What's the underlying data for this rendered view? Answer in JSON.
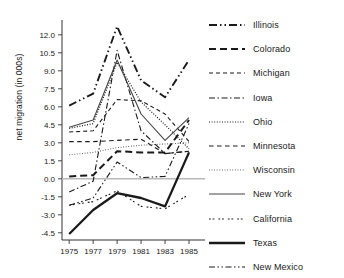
{
  "chart_data": {
    "type": "line",
    "title": "",
    "xlabel": "",
    "ylabel": "net migration (in 000s)",
    "x": [
      1975,
      1977,
      1979,
      1981,
      1983,
      1985
    ],
    "xtick_labels": [
      "1975",
      "1977",
      "1979",
      "1981",
      "1983",
      "1985"
    ],
    "ytick_labels": [
      "12.0",
      "10.5",
      "9.0",
      "7.5",
      "6.0",
      "4.5",
      "3.0",
      "1.5",
      "0.0",
      "-1.5",
      "-3.0",
      "-4.5"
    ],
    "ytick_values": [
      12.0,
      10.5,
      9.0,
      7.5,
      6.0,
      4.5,
      3.0,
      1.5,
      0.0,
      -1.5,
      -3.0,
      -4.5
    ],
    "xlim": [
      1974.4,
      1986.0
    ],
    "ylim": [
      -5.1,
      12.9
    ],
    "grid": false,
    "zero_line": true,
    "legend_position": "right",
    "series": [
      {
        "name": "Illinois",
        "dash": "8,3,1.5,3,1.5,3",
        "width": 1.9,
        "color": "#1a1a1a",
        "values": [
          6.1,
          7.1,
          12.7,
          8.2,
          6.8,
          9.9
        ]
      },
      {
        "name": "Colorado",
        "dash": "7,4",
        "width": 2.0,
        "color": "#1a1a1a",
        "values": [
          0.2,
          0.3,
          2.3,
          2.2,
          2.2,
          4.9
        ]
      },
      {
        "name": "Michigan",
        "dash": "4,3",
        "width": 1.1,
        "color": "#1a1a1a",
        "values": [
          3.9,
          4.0,
          6.6,
          6.5,
          5.4,
          3.1
        ]
      },
      {
        "name": "Iowa",
        "dash": "6,2.5,1.5,2.5",
        "width": 1.1,
        "color": "#1a1a1a",
        "values": [
          -1.1,
          -0.2,
          10.7,
          4.0,
          2.1,
          2.3
        ]
      },
      {
        "name": "Ohio",
        "dash": "1,1.6",
        "width": 1.2,
        "color": "#1a1a1a",
        "values": [
          4.2,
          4.6,
          9.7,
          6.4,
          4.5,
          2.5
        ]
      },
      {
        "name": "Minnesota",
        "dash": "4.5,3.5",
        "width": 1.1,
        "color": "#1a1a1a",
        "values": [
          3.1,
          3.1,
          3.2,
          3.3,
          2.1,
          2.3
        ]
      },
      {
        "name": "Wisconsin",
        "dash": "0.8,1.8",
        "width": 1.1,
        "color": "#4a4a4a",
        "values": [
          2.0,
          2.2,
          2.6,
          2.8,
          2.9,
          3.0
        ]
      },
      {
        "name": "New York",
        "dash": "none",
        "width": 1.1,
        "color": "#444444",
        "values": [
          4.3,
          4.9,
          9.9,
          5.4,
          3.2,
          5.1
        ]
      },
      {
        "name": "California",
        "dash": "1.8,1.8,1.8,4",
        "width": 1.1,
        "color": "#1a1a1a",
        "values": [
          -2.2,
          -1.9,
          -1.0,
          -2.3,
          -2.5,
          -1.3
        ]
      },
      {
        "name": "Texas",
        "dash": "none",
        "width": 2.3,
        "color": "#1a1a1a",
        "values": [
          -4.6,
          -2.6,
          -1.2,
          -1.6,
          -2.3,
          2.2
        ]
      },
      {
        "name": "New Mexico",
        "dash": "6,2.5,1.5,2.5,1.5,2.5",
        "width": 1.1,
        "color": "#1a1a1a",
        "values": [
          -2.2,
          -1.6,
          1.4,
          0.1,
          0.2,
          4.6
        ]
      }
    ]
  }
}
